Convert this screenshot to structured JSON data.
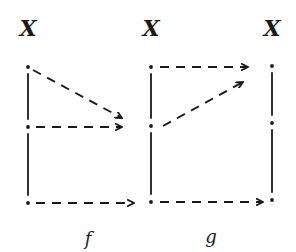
{
  "diagram": {
    "type": "commutative-style mapping diagram",
    "ink_color": "#1a1a1a",
    "sets": [
      {
        "id": "x1",
        "label": "X",
        "x": 28,
        "label_y": 28,
        "points_y": [
          67,
          127,
          203
        ]
      },
      {
        "id": "x2",
        "label": "X",
        "x": 151,
        "label_y": 28,
        "points_y": [
          67,
          126,
          202
        ]
      },
      {
        "id": "x3",
        "label": "X",
        "x": 272,
        "label_y": 28,
        "points_y": [
          66,
          123,
          200
        ]
      }
    ],
    "maps": [
      {
        "id": "f",
        "label": "f",
        "label_x": 88,
        "label_y": 238,
        "arrows": [
          {
            "from": [
              33,
              70
            ],
            "to": [
              122,
              118
            ]
          },
          {
            "from": [
              36,
              127
            ],
            "to": [
              122,
              127
            ]
          },
          {
            "from": [
              36,
              203
            ],
            "to": [
              134,
              203
            ]
          }
        ]
      },
      {
        "id": "g",
        "label": "g",
        "label_x": 211,
        "label_y": 236,
        "arrows": [
          {
            "from": [
              160,
              67
            ],
            "to": [
              248,
              67
            ]
          },
          {
            "from": [
              163,
              126
            ],
            "to": [
              243,
              82
            ]
          },
          {
            "from": [
              160,
              202
            ],
            "to": [
              263,
              202
            ]
          }
        ]
      }
    ]
  }
}
